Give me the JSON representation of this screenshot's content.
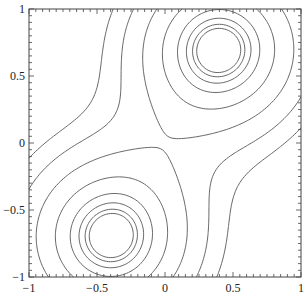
{
  "chart_data": {
    "type": "contour",
    "title": "",
    "xlabel": "",
    "ylabel": "",
    "xlim": [
      -1,
      1
    ],
    "ylim": [
      -1,
      1
    ],
    "grid": false,
    "legend": null,
    "x_ticks": [
      {
        "value": -1,
        "label": "−1"
      },
      {
        "value": -0.5,
        "label": "−0.5"
      },
      {
        "value": 0,
        "label": "0"
      },
      {
        "value": 0.5,
        "label": "0.5"
      },
      {
        "value": 1,
        "label": "1"
      }
    ],
    "y_ticks": [
      {
        "value": -1,
        "label": "−1"
      },
      {
        "value": -0.5,
        "label": "−0.5"
      },
      {
        "value": 0,
        "label": "0"
      },
      {
        "value": 0.5,
        "label": "0.5"
      },
      {
        "value": 1,
        "label": "1"
      }
    ],
    "peaks": [
      {
        "x": 0.4,
        "y": 0.7
      },
      {
        "x": -0.4,
        "y": -0.7
      }
    ],
    "contour_function": "exp(-((x-0.4)^2+(y-0.7)^2)/0.5) + exp(-((x+0.4)^2+(y+0.7)^2)/0.5)",
    "sigma2": 0.5,
    "levels": [
      0.25,
      0.38,
      0.55,
      0.72,
      0.84,
      0.9,
      0.935,
      0.955
    ],
    "line_color": "#555555",
    "frame": {
      "left": 29,
      "top": 9,
      "right": 301,
      "bottom": 277
    }
  }
}
